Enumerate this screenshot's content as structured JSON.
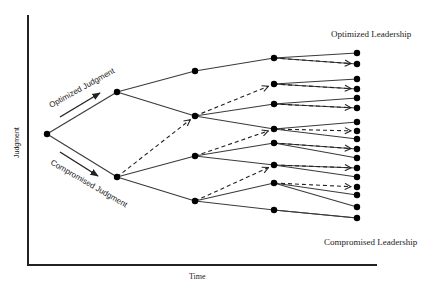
{
  "labels": {
    "y_axis": "Judgment",
    "x_axis": "Time",
    "top_branch": "Optimized Judgment",
    "bottom_branch": "Compromised Judgment",
    "top_outcome": "Optimized Leadership",
    "bottom_outcome": "Compromised Leadership"
  },
  "colors": {
    "line": "#3a3a3a",
    "node": "#000000",
    "axis": "#222222",
    "text": "#222222"
  },
  "tree": {
    "root": [
      47,
      134
    ],
    "level1": [
      [
        117,
        92
      ],
      [
        117,
        177
      ]
    ],
    "level2": [
      [
        195,
        71
      ],
      [
        195,
        116
      ],
      [
        195,
        156
      ],
      [
        195,
        201
      ]
    ],
    "level3": [
      [
        274,
        58
      ],
      [
        274,
        84
      ],
      [
        274,
        104
      ],
      [
        274,
        129
      ],
      [
        274,
        143
      ],
      [
        274,
        165
      ],
      [
        274,
        183
      ],
      [
        274,
        210
      ]
    ],
    "level4": [
      [
        357,
        53
      ],
      [
        357,
        64
      ],
      [
        357,
        79
      ],
      [
        357,
        89
      ],
      [
        357,
        98
      ],
      [
        357,
        108
      ],
      [
        357,
        122
      ],
      [
        357,
        131
      ],
      [
        357,
        139
      ],
      [
        357,
        149
      ],
      [
        357,
        158
      ],
      [
        357,
        168
      ],
      [
        357,
        177
      ],
      [
        357,
        187
      ],
      [
        357,
        195
      ],
      [
        357,
        207
      ],
      [
        357,
        218
      ]
    ],
    "solid_edges": [
      [
        "root",
        0,
        "level1",
        0
      ],
      [
        "root",
        0,
        "level1",
        1
      ],
      [
        "level1",
        0,
        "level2",
        0
      ],
      [
        "level1",
        0,
        "level2",
        1
      ],
      [
        "level1",
        1,
        "level2",
        2
      ],
      [
        "level1",
        1,
        "level2",
        3
      ],
      [
        "level2",
        0,
        "level3",
        0
      ],
      [
        "level2",
        1,
        "level3",
        2
      ],
      [
        "level2",
        1,
        "level3",
        3
      ],
      [
        "level2",
        2,
        "level3",
        4
      ],
      [
        "level2",
        2,
        "level3",
        5
      ],
      [
        "level2",
        3,
        "level3",
        6
      ],
      [
        "level2",
        3,
        "level3",
        7
      ],
      [
        "level3",
        0,
        "level4",
        0
      ],
      [
        "level3",
        0,
        "level4",
        1
      ],
      [
        "level3",
        1,
        "level4",
        2
      ],
      [
        "level3",
        1,
        "level4",
        3
      ],
      [
        "level3",
        2,
        "level4",
        4
      ],
      [
        "level3",
        2,
        "level4",
        5
      ],
      [
        "level3",
        3,
        "level4",
        6
      ],
      [
        "level3",
        3,
        "level4",
        8
      ],
      [
        "level3",
        4,
        "level4",
        9
      ],
      [
        "level3",
        4,
        "level4",
        10
      ],
      [
        "level3",
        5,
        "level4",
        11
      ],
      [
        "level3",
        5,
        "level4",
        12
      ],
      [
        "level3",
        6,
        "level4",
        14
      ],
      [
        "level3",
        6,
        "level4",
        15
      ],
      [
        "level3",
        7,
        "level4",
        16
      ],
      [
        "level3",
        7,
        "level4",
        16
      ]
    ],
    "dashed_edges": [
      [
        "level1",
        1,
        "level2",
        1
      ],
      [
        "level2",
        1,
        "level3",
        1
      ],
      [
        "level2",
        2,
        "level3",
        3
      ],
      [
        "level2",
        3,
        "level3",
        5
      ],
      [
        "level3",
        0,
        "level4",
        1
      ],
      [
        "level3",
        1,
        "level4",
        3
      ],
      [
        "level3",
        2,
        "level4",
        5
      ],
      [
        "level3",
        3,
        "level4",
        7
      ],
      [
        "level3",
        4,
        "level4",
        9
      ],
      [
        "level3",
        5,
        "level4",
        11
      ],
      [
        "level3",
        6,
        "level4",
        13
      ]
    ]
  }
}
